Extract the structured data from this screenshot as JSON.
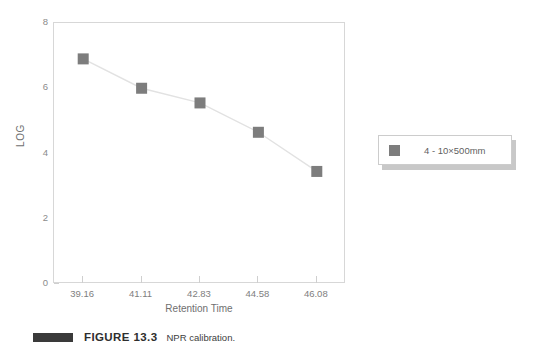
{
  "chart_data": {
    "type": "line",
    "title": "",
    "xlabel": "Retention Time",
    "ylabel": "LOG",
    "categories": [
      "39.16",
      "41.11",
      "42.83",
      "44.58",
      "46.08"
    ],
    "series": [
      {
        "name": "4 - 10×500mm",
        "values": [
          6.9,
          6.0,
          5.55,
          4.65,
          3.45
        ],
        "marker": "square",
        "color": "#7d7d7d",
        "line_color": "#e2e2e2"
      }
    ],
    "ylim": [
      0,
      8
    ],
    "yticks": [
      0,
      2,
      4,
      6,
      8
    ],
    "grid": false,
    "legend_position": "right-outside"
  },
  "axes": {
    "y_title": "LOG",
    "y_ticks": [
      "0",
      "2",
      "4",
      "6",
      "8"
    ],
    "x_title": "Retention Time",
    "x_ticks": [
      "39.16",
      "41.11",
      "42.83",
      "44.58",
      "46.08"
    ]
  },
  "legend": {
    "entries": [
      {
        "label": "4 - 10×500mm",
        "color": "#7d7d7d"
      }
    ]
  },
  "caption": {
    "figure_label": "FIGURE 13.3",
    "text": "NPR calibration."
  },
  "colors": {
    "marker": "#7d7d7d",
    "line": "#e2e2e2",
    "frame": "#d7d7d7",
    "tick_text": "#8b8b8b",
    "axis_title": "#6f6f6f",
    "caption_bar": "#3a3a3a"
  }
}
